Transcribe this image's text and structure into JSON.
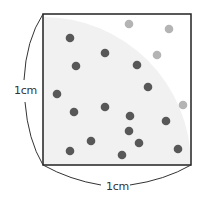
{
  "diagram": {
    "side_label_left": "1cm",
    "side_label_bottom": "1cm",
    "square": {
      "x": 43,
      "y": 14,
      "size": 148
    },
    "quarter_circle": {
      "center": [
        43,
        165
      ],
      "radius": 148
    },
    "colors": {
      "inside_dot": "#585858",
      "outside_dot": "#b4b4b4",
      "quarter_fill": "#f1f1f1",
      "square_stroke": "#222222"
    },
    "points_inside": [
      [
        70,
        38
      ],
      [
        105,
        53
      ],
      [
        76,
        66
      ],
      [
        137,
        65
      ],
      [
        57,
        94
      ],
      [
        148,
        87
      ],
      [
        74,
        112
      ],
      [
        105,
        107
      ],
      [
        130,
        116
      ],
      [
        166,
        121
      ],
      [
        129,
        131
      ],
      [
        139,
        143
      ],
      [
        91,
        141
      ],
      [
        70,
        151
      ],
      [
        122,
        155
      ],
      [
        178,
        149
      ]
    ],
    "points_outside": [
      [
        129,
        24
      ],
      [
        169,
        29
      ],
      [
        157,
        55
      ],
      [
        183,
        105
      ]
    ]
  }
}
